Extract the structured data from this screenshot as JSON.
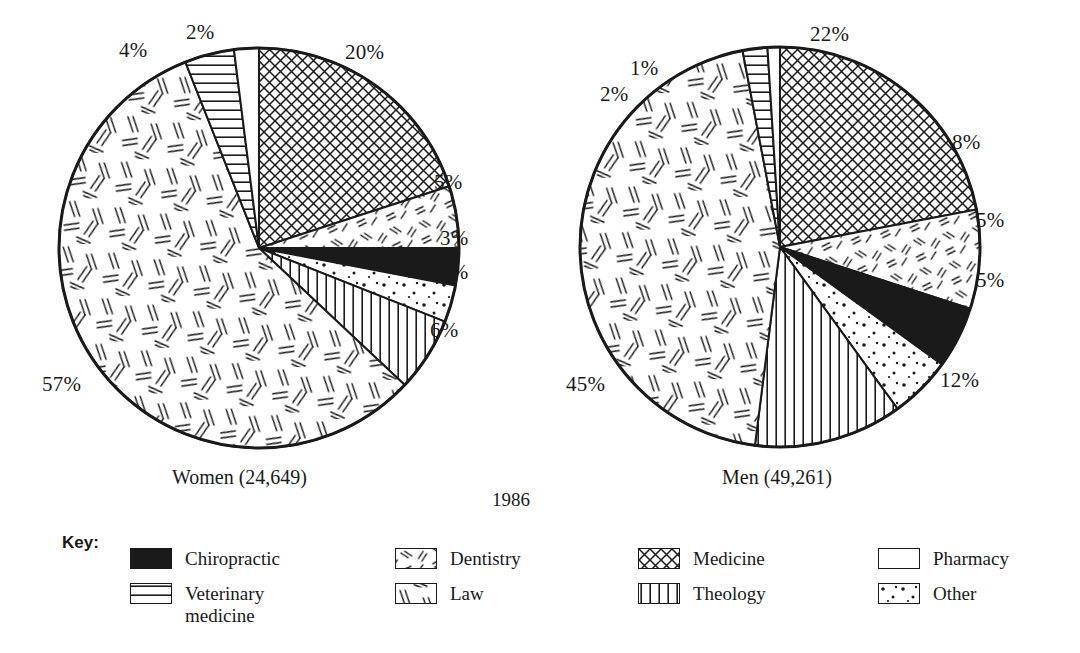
{
  "year": "1986",
  "key_title": "Key:",
  "charts": [
    {
      "caption": "Women (24,649)",
      "cx": 259,
      "cy": 248,
      "r": 200,
      "slices": [
        {
          "name": "Medicine",
          "pattern": "crosshatch",
          "value": 20,
          "label": "20%",
          "lx": 345,
          "ly": 40
        },
        {
          "name": "Dentistry",
          "pattern": "dashes",
          "value": 5,
          "label": "5%",
          "lx": 434,
          "ly": 170
        },
        {
          "name": "Chiropractic",
          "pattern": "solid",
          "value": 3,
          "label": "3%",
          "lx": 440,
          "ly": 226
        },
        {
          "name": "Other",
          "pattern": "dots",
          "value": 3,
          "label": "3%",
          "lx": 440,
          "ly": 260
        },
        {
          "name": "Theology",
          "pattern": "vertical",
          "value": 6,
          "label": "6%",
          "lx": 430,
          "ly": 318
        },
        {
          "name": "Law",
          "pattern": "slashes",
          "value": 57,
          "label": "57%",
          "lx": 42,
          "ly": 372
        },
        {
          "name": "Veterinary medicine",
          "pattern": "horizontal",
          "value": 4,
          "label": "4%",
          "lx": 119,
          "ly": 38
        },
        {
          "name": "Pharmacy",
          "pattern": "blank",
          "value": 2,
          "label": "2%",
          "lx": 186,
          "ly": 20
        }
      ]
    },
    {
      "caption": "Men (49,261)",
      "cx": 780,
      "cy": 247,
      "r": 200,
      "slices": [
        {
          "name": "Medicine",
          "pattern": "crosshatch",
          "value": 22,
          "label": "22%",
          "lx": 810,
          "ly": 22
        },
        {
          "name": "Dentistry",
          "pattern": "dashes",
          "value": 8,
          "label": "8%",
          "lx": 952,
          "ly": 130
        },
        {
          "name": "Chiropractic",
          "pattern": "solid",
          "value": 5,
          "label": "5%",
          "lx": 976,
          "ly": 208
        },
        {
          "name": "Other",
          "pattern": "dots",
          "value": 5,
          "label": "5%",
          "lx": 976,
          "ly": 268
        },
        {
          "name": "Theology",
          "pattern": "vertical",
          "value": 12,
          "label": "12%",
          "lx": 940,
          "ly": 368
        },
        {
          "name": "Law",
          "pattern": "slashes",
          "value": 45,
          "label": "45%",
          "lx": 566,
          "ly": 372
        },
        {
          "name": "Veterinary medicine",
          "pattern": "horizontal",
          "value": 2,
          "label": "2%",
          "lx": 600,
          "ly": 82
        },
        {
          "name": "Pharmacy",
          "pattern": "blank",
          "value": 1,
          "label": "1%",
          "lx": 630,
          "ly": 56
        }
      ]
    }
  ],
  "legend": [
    {
      "label": "Chiropractic",
      "pattern": "solid",
      "x": 130,
      "y": 0
    },
    {
      "label": "Veterinary\nmedicine",
      "pattern": "horizontal",
      "x": 130,
      "y": 35
    },
    {
      "label": "Dentistry",
      "pattern": "dashes",
      "x": 395,
      "y": 0
    },
    {
      "label": "Law",
      "pattern": "slashes",
      "x": 395,
      "y": 35
    },
    {
      "label": "Medicine",
      "pattern": "crosshatch",
      "x": 638,
      "y": 0
    },
    {
      "label": "Theology",
      "pattern": "vertical",
      "x": 638,
      "y": 35
    },
    {
      "label": "Pharmacy",
      "pattern": "blank",
      "x": 878,
      "y": 0
    },
    {
      "label": "Other",
      "pattern": "dots",
      "x": 878,
      "y": 35
    }
  ],
  "chart_data": {
    "type": "pie",
    "title": "",
    "subtitle": "1986",
    "categories": [
      "Medicine",
      "Dentistry",
      "Chiropractic",
      "Other",
      "Theology",
      "Law",
      "Veterinary medicine",
      "Pharmacy"
    ],
    "series": [
      {
        "name": "Women (24,649)",
        "total": 24649,
        "values": [
          20,
          5,
          3,
          3,
          6,
          57,
          4,
          2
        ]
      },
      {
        "name": "Men (49,261)",
        "total": 49261,
        "values": [
          22,
          8,
          5,
          5,
          12,
          45,
          2,
          1
        ]
      }
    ],
    "units": "percent",
    "legend_position": "bottom",
    "grid": false,
    "colors": {
      "ink": "#1a1a1a",
      "background": "#ffffff"
    }
  }
}
